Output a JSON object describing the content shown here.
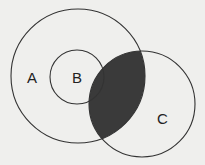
{
  "diagram": {
    "type": "venn",
    "sets": [
      {
        "label": "A",
        "cx": 78,
        "cy": 76,
        "r": 67
      },
      {
        "label": "B",
        "cx": 77,
        "cy": 77,
        "r": 27
      },
      {
        "label": "C",
        "cx": 142,
        "cy": 104,
        "r": 53
      }
    ],
    "shaded_region": "A ∩ C",
    "colors": {
      "background": "#efefed",
      "stroke": "#333333",
      "shade": "#3a3a3a"
    }
  }
}
